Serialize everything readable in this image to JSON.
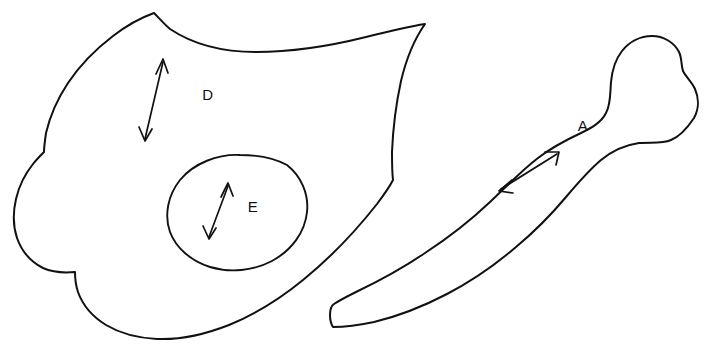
{
  "figure": {
    "background_color": "#ffffff",
    "ink_color": "#111111",
    "width": 704,
    "height": 353
  },
  "labels": {
    "d": "D",
    "e": "E",
    "a": "A"
  },
  "shapes": [
    {
      "id": "shape-d",
      "label": "D",
      "description": "large irregular blob with pointed tail at upper right",
      "label_x": 208,
      "label_y": 100
    },
    {
      "id": "shape-e",
      "label": "E",
      "description": "tilted ellipse inscribed within shape D",
      "label_x": 253,
      "label_y": 212
    },
    {
      "id": "shape-a",
      "label": "A",
      "description": "elongated bone-like form with bulbous head at right",
      "label_x": 583,
      "label_y": 131
    }
  ],
  "arrows": [
    {
      "id": "arrow-d",
      "belongs_to": "D",
      "style": "double-headed",
      "start_x": 163,
      "start_y": 60,
      "end_x": 145,
      "end_y": 141
    },
    {
      "id": "arrow-e",
      "belongs_to": "E",
      "style": "double-headed",
      "start_x": 228,
      "start_y": 184,
      "end_x": 209,
      "end_y": 239
    },
    {
      "id": "arrow-a",
      "belongs_to": "A",
      "style": "double-headed",
      "start_x": 559,
      "start_y": 152,
      "end_x": 499,
      "end_y": 191
    }
  ]
}
